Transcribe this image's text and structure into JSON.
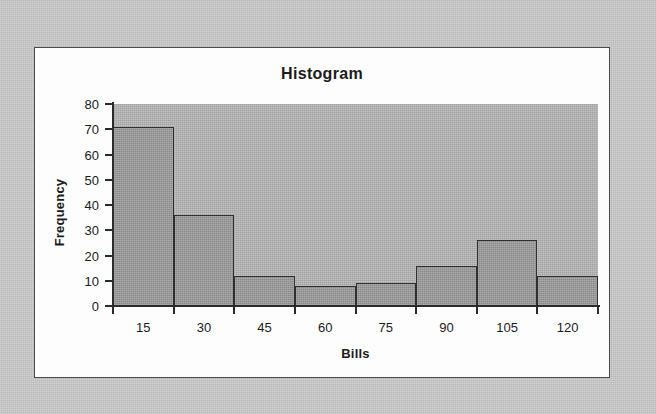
{
  "page": {
    "background_color": "#c9c9c9",
    "panel_background_color": "#fdfdfd",
    "panel_border_color": "#4a4a4a"
  },
  "chart_data": {
    "type": "bar",
    "title": "Histogram",
    "xlabel": "Bills",
    "ylabel": "Frequency",
    "categories": [
      "15",
      "30",
      "45",
      "60",
      "75",
      "90",
      "105",
      "120"
    ],
    "values": [
      71,
      36,
      12,
      8,
      9,
      16,
      26,
      12
    ],
    "ylim": [
      0,
      80
    ],
    "yticks": [
      "80",
      "70",
      "60",
      "50",
      "40",
      "30",
      "20",
      "10",
      "0"
    ],
    "ytick_values": [
      80,
      70,
      60,
      50,
      40,
      30,
      20,
      10,
      0
    ],
    "grid": false,
    "legend": "none",
    "series_name": "Frequency",
    "plot_background_color": "#b3b3b3",
    "bar_fill_color": "#9a9a9a",
    "bar_border_color": "#2f2f2f",
    "axis_color": "#2b2b2b"
  }
}
